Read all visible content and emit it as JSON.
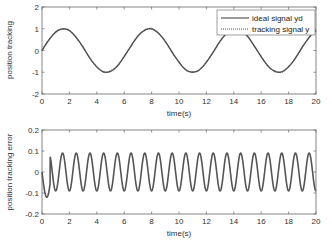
{
  "chart_data": [
    {
      "type": "line",
      "title": "",
      "xlabel": "time(s)",
      "ylabel": "position tracking",
      "xlim": [
        0,
        20
      ],
      "ylim": [
        -2,
        2
      ],
      "xticks": [
        0,
        2,
        4,
        6,
        8,
        10,
        12,
        14,
        16,
        18,
        20
      ],
      "yticks": [
        -2,
        -1,
        0,
        1,
        2
      ],
      "xtick_labels": [
        "0",
        "2",
        "4",
        "6",
        "8",
        "10",
        "12",
        "14",
        "16",
        "18",
        "20"
      ],
      "ytick_labels": [
        "-2",
        "-1",
        "0",
        "1",
        "2"
      ],
      "grid": false,
      "legend_position": "top-right",
      "series": [
        {
          "name": "ideal signal yd",
          "style": "solid",
          "formula": "sin(t)",
          "amplitude": 1,
          "angular_frequency": 1
        },
        {
          "name": "tracking signal y",
          "style": "dotted",
          "formula": "sin(t) - e(t)",
          "amplitude": 1,
          "angular_frequency": 1
        }
      ]
    },
    {
      "type": "line",
      "title": "",
      "xlabel": "time(s)",
      "ylabel": "position tracking error",
      "xlim": [
        0,
        20
      ],
      "ylim": [
        -0.2,
        0.2
      ],
      "xticks": [
        0,
        2,
        4,
        6,
        8,
        10,
        12,
        14,
        16,
        18,
        20
      ],
      "yticks": [
        -0.2,
        -0.1,
        0,
        0.1,
        0.2
      ],
      "xtick_labels": [
        "0",
        "2",
        "4",
        "6",
        "8",
        "10",
        "12",
        "14",
        "16",
        "18",
        "20"
      ],
      "ytick_labels": [
        "-0.2",
        "-0.1",
        "0",
        "0.1",
        "0.2"
      ],
      "grid": false,
      "series": [
        {
          "name": "position tracking error",
          "style": "solid",
          "initial_value": 0,
          "initial_min": -0.12,
          "initial_min_time": 0.35,
          "steady_amplitude": 0.09,
          "period": 1.0
        }
      ]
    }
  ]
}
